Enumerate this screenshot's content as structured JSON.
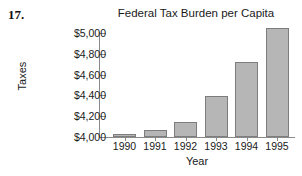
{
  "problem": {
    "number": "17."
  },
  "chart_data": {
    "type": "bar",
    "title": "Federal Tax Burden per Capita",
    "xlabel": "Year",
    "ylabel": "Taxes",
    "categories": [
      "1990",
      "1991",
      "1992",
      "1993",
      "1994",
      "1995"
    ],
    "values": [
      4030,
      4065,
      4140,
      4390,
      4720,
      5050
    ],
    "ylim": [
      4000,
      5000
    ],
    "ytick_values": [
      4000,
      4200,
      4400,
      4600,
      4800,
      5000
    ],
    "ytick_labels": [
      "$4,000",
      "$4,200",
      "$4,400",
      "$4,600",
      "$4,800",
      "$5,000"
    ],
    "grid": false,
    "legend": false,
    "bar_color": "#b6b6b6",
    "bar_border_color": "#7d7d7d",
    "axis_color": "#8a8a8a",
    "background": "#ffffff"
  }
}
